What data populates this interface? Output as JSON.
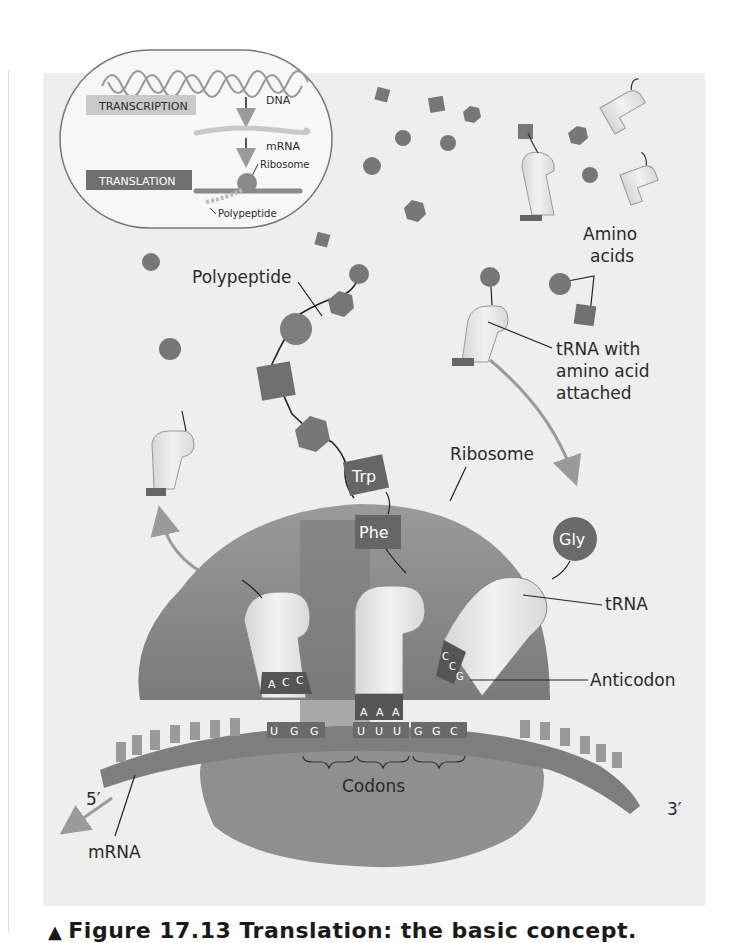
{
  "overview_inset": {
    "labels": {
      "transcription": "TRANSCRIPTION",
      "translation": "TRANSLATION",
      "dna": "DNA",
      "mrna": "mRNA",
      "ribosome": "Ribosome",
      "polypeptide": "Polypeptide"
    }
  },
  "labels": {
    "polypeptide": "Polypeptide",
    "amino_acids_line1": "Amino",
    "amino_acids_line2": "acids",
    "trna_attached_line1": "tRNA with",
    "trna_attached_line2": "amino acid",
    "trna_attached_line3": "attached",
    "ribosome": "Ribosome",
    "trna": "tRNA",
    "anticodon": "Anticodon",
    "codons": "Codons",
    "mrna": "mRNA",
    "five_prime": "5′",
    "three_prime": "3′"
  },
  "amino_acid_tags": {
    "trp": "Trp",
    "phe": "Phe",
    "gly": "Gly"
  },
  "anticodons": {
    "left_trna": [
      "A",
      "C",
      "C"
    ],
    "middle_trna": [
      "A",
      "A",
      "A"
    ],
    "right_trna": [
      "C",
      "C",
      "G"
    ]
  },
  "mrna_codons": {
    "codon1": [
      "U",
      "G",
      "G"
    ],
    "codon2": [
      "U",
      "U",
      "U"
    ],
    "codon3": [
      "G",
      "G",
      "C"
    ]
  },
  "caption": {
    "marker": "▲",
    "text": "Figure 17.13 Translation: the basic concept."
  },
  "colors": {
    "panel_bg": "#eeeeee",
    "ribosome": "#8c8c8c",
    "ribosome_dark": "#6e6e6e",
    "trna_body": "#e4e4e4",
    "amino_acid": "#777777",
    "arrow": "#9a9a9a",
    "text": "#2a2a2a"
  }
}
